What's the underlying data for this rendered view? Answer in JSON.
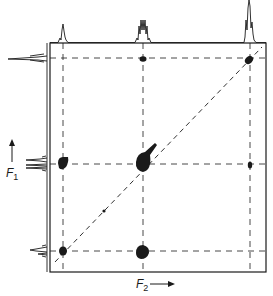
{
  "diagram": {
    "type": "2D NMR COSY spectrum",
    "axes": {
      "f1": {
        "label": "F",
        "subscript": "1",
        "direction": "up"
      },
      "f2": {
        "label": "F",
        "subscript": "2",
        "direction": "right"
      }
    },
    "frame": {
      "x0": 50,
      "y0": 43,
      "x1": 266,
      "y1": 272
    },
    "grid_x": [
      63,
      143,
      250
    ],
    "grid_y": [
      58,
      164,
      251
    ],
    "diagonal_peaks": [
      {
        "x": 63,
        "y": 251,
        "size": "medium"
      },
      {
        "x": 143,
        "y": 164,
        "size": "large"
      },
      {
        "x": 250,
        "y": 58,
        "size": "medium"
      }
    ],
    "cross_peaks": [
      {
        "x": 143,
        "y": 58,
        "size": "small"
      },
      {
        "x": 63,
        "y": 164,
        "size": "medium"
      },
      {
        "x": 250,
        "y": 164,
        "size": "small"
      },
      {
        "x": 143,
        "y": 251,
        "size": "medium"
      }
    ],
    "colors": {
      "ink": "#1a1a1a",
      "background": "#ffffff"
    }
  }
}
